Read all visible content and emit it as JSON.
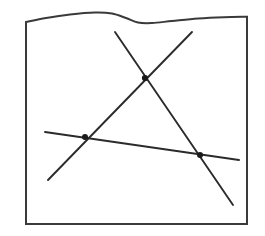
{
  "figure": {
    "background_color": "#ffffff",
    "ink_color": "#2b2b2b",
    "frame_stroke_color": "#3a3a3a",
    "node_color": "#1a1a1a",
    "canvas": {
      "width": 265,
      "height": 236
    },
    "caption": ""
  },
  "frame": {
    "name": "torn-top-rectangle",
    "left_x": 26,
    "right_x": 247,
    "bottom_y": 224,
    "stroke_width": 2.0,
    "top_edge_type": "wavy-torn",
    "top_edge_points": [
      {
        "x": 26,
        "y": 22
      },
      {
        "x": 46,
        "y": 18
      },
      {
        "x": 70,
        "y": 14.5
      },
      {
        "x": 95,
        "y": 12.5
      },
      {
        "x": 112,
        "y": 13.5
      },
      {
        "x": 126,
        "y": 18
      },
      {
        "x": 138,
        "y": 22.5
      },
      {
        "x": 152,
        "y": 23
      },
      {
        "x": 172,
        "y": 21
      },
      {
        "x": 198,
        "y": 18.5
      },
      {
        "x": 224,
        "y": 17.2
      },
      {
        "x": 247,
        "y": 16.8
      }
    ]
  },
  "lines": [
    {
      "id": "line-a",
      "label": "descending-line",
      "x1": 115,
      "y1": 32,
      "x2": 233,
      "y2": 205,
      "stroke_width": 1.9
    },
    {
      "id": "line-b",
      "label": "ascending-line",
      "x1": 192,
      "y1": 32,
      "x2": 48,
      "y2": 180,
      "stroke_width": 1.9
    },
    {
      "id": "line-c",
      "label": "near-horizontal-line",
      "x1": 45,
      "y1": 132,
      "x2": 239,
      "y2": 160,
      "stroke_width": 1.9
    }
  ],
  "intersections": [
    {
      "id": "node-top",
      "label": "A-B",
      "x": 145,
      "y": 78,
      "radius": 3.1
    },
    {
      "id": "node-left",
      "label": "B-C",
      "x": 85,
      "y": 137,
      "radius": 3.0
    },
    {
      "id": "node-right",
      "label": "A-C",
      "x": 200,
      "y": 155,
      "radius": 3.0
    }
  ]
}
